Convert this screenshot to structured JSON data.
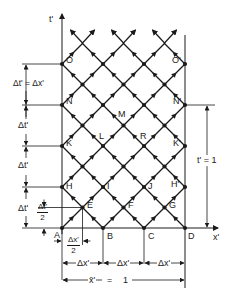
{
  "axes": {
    "t_axis_label": "t'",
    "x_axis_label": "x'"
  },
  "points": {
    "A": "A",
    "B": "B",
    "C": "C",
    "D": "D",
    "E": "E",
    "F": "F",
    "G": "G",
    "H": "H",
    "I": "I",
    "J": "J",
    "H_prime": "H'",
    "K": "K",
    "L": "L",
    "R": "R",
    "K_prime": "K'",
    "M": "M",
    "N": "N",
    "N_prime": "N'",
    "O": "O",
    "O_prime": "O'"
  },
  "left_dimensions": {
    "top": "Δt' = Δx'",
    "second": "Δt'",
    "third": "Δt'",
    "bottom": "Δt'",
    "half_num": "Δt'",
    "half_den": "2"
  },
  "bottom_dimensions": {
    "half_num": "Δx'",
    "half_den": "2",
    "seg1": "Δx'",
    "seg2": "Δx'",
    "seg3": "Δx'",
    "total_left": "x̄'",
    "total_eq": "=",
    "total_right": "1"
  },
  "right_dimension": {
    "label": "t' = 1"
  },
  "geometry": {
    "origin_x": 62,
    "origin_y": 228,
    "step": 41,
    "columns": 3,
    "rows": 4
  },
  "colors": {
    "ink": "#1a1a1a",
    "background": "#ffffff"
  }
}
